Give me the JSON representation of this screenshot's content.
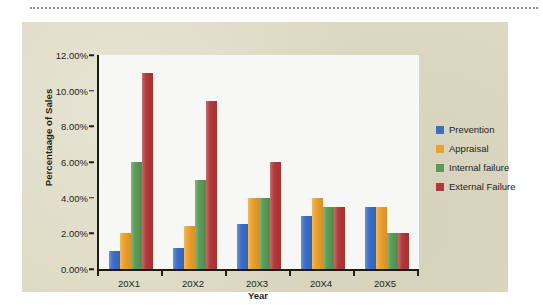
{
  "page": {
    "background": "#ffffff",
    "card_background": "#ddd9c3",
    "plot_background": "#f7f7f5",
    "axis_color": "#1b1b1b",
    "text_color": "#231f1c",
    "divider": "top-dotted-rule"
  },
  "chart_data": {
    "type": "bar",
    "title": "",
    "xlabel": "Year",
    "ylabel": "Percentaage of Sales",
    "categories": [
      "20X1",
      "20X2",
      "20X3",
      "20X4",
      "20X5"
    ],
    "ylim": [
      0,
      12
    ],
    "ytick_values": [
      0,
      2,
      4,
      6,
      8,
      10,
      12
    ],
    "ytick_labels": [
      "0.00%",
      "2.00%",
      "4.00%",
      "6.00%",
      "8.00%",
      "10.00%",
      "12.00%"
    ],
    "unit": "%",
    "grid": false,
    "legend_position": "right",
    "series": [
      {
        "name": "Prevention",
        "color": "#3b6fc4",
        "values": [
          1.0,
          1.2,
          2.5,
          3.0,
          3.5
        ]
      },
      {
        "name": "Appraisal",
        "color": "#eda02e",
        "values": [
          2.0,
          2.4,
          4.0,
          4.0,
          3.5
        ]
      },
      {
        "name": "Internal failure",
        "color": "#5a9c56",
        "values": [
          6.0,
          5.0,
          4.0,
          3.5,
          2.0
        ]
      },
      {
        "name": "External Failure",
        "color": "#b03a3a",
        "values": [
          11.0,
          9.4,
          6.0,
          3.5,
          2.0
        ]
      }
    ]
  }
}
